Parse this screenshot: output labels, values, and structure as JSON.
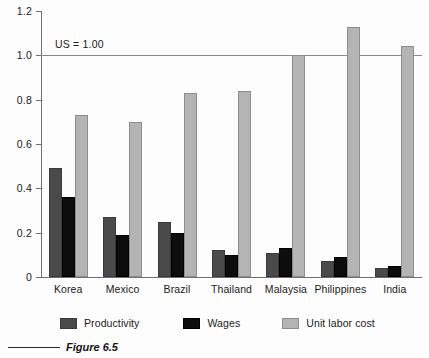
{
  "figure": {
    "caption": "Figure 6.5",
    "caption_rule": "horizontal-rule"
  },
  "chart_data": {
    "type": "bar",
    "title": "",
    "xlabel": "",
    "ylabel": "",
    "ylim": [
      0,
      1.2
    ],
    "yticks": [
      "0",
      "0.2",
      "0.4",
      "0.6",
      "0.8",
      "1.0",
      "1.2"
    ],
    "ytick_values": [
      0,
      0.2,
      0.4,
      0.6,
      0.8,
      1.0,
      1.2
    ],
    "grid": false,
    "legend_position": "bottom",
    "annotations": [
      {
        "text": "US = 1.00",
        "y": 1.0
      }
    ],
    "reference_line": {
      "value": 1.0,
      "label": "US = 1.00",
      "color": "#8a8a8a"
    },
    "categories": [
      "Korea",
      "Mexico",
      "Brazil",
      "Thailand",
      "Malaysia",
      "Philippines",
      "India"
    ],
    "series": [
      {
        "name": "Productivity",
        "color": "#4a4a4a",
        "values": [
          0.49,
          0.27,
          0.25,
          0.12,
          0.11,
          0.07,
          0.04
        ]
      },
      {
        "name": "Wages",
        "color": "#0d0d0d",
        "values": [
          0.36,
          0.19,
          0.2,
          0.1,
          0.13,
          0.09,
          0.05
        ]
      },
      {
        "name": "Unit labor cost",
        "color": "#b4b4b4",
        "values": [
          0.73,
          0.7,
          0.83,
          0.84,
          1.0,
          1.13,
          1.04
        ]
      }
    ]
  }
}
